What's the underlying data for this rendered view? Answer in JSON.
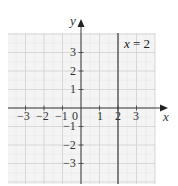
{
  "chart_data": {
    "type": "line",
    "title": "",
    "xlabel": "x",
    "ylabel": "y",
    "xlim": [
      -4,
      4
    ],
    "ylim": [
      -4,
      4
    ],
    "grid": true,
    "x_ticks": [
      "-3",
      "-2",
      "-1",
      "0",
      "1",
      "2",
      "3"
    ],
    "y_ticks": [
      "3",
      "2",
      "1",
      "-1",
      "-2",
      "-3"
    ],
    "origin_label": "0",
    "series": [
      {
        "name": "x = 2",
        "type": "vertical_line",
        "x": 2,
        "y_range": [
          -4,
          4
        ]
      }
    ],
    "annotations": [
      {
        "text": "x = 2",
        "position": "upper-right"
      }
    ]
  },
  "labels": {
    "x_axis": "x",
    "y_axis": "y",
    "line": "x = 2",
    "origin": "0",
    "x_ticks": [
      "−3",
      "−2",
      "−1",
      "1",
      "2",
      "3"
    ],
    "y_ticks_pos": [
      "3",
      "2",
      "1"
    ],
    "y_ticks_neg": [
      "−1",
      "−2",
      "−3"
    ]
  },
  "colors": {
    "grid_bg": "#f4f4f4",
    "grid_major": "#d6d6d6",
    "grid_minor": "#e6e6e6",
    "axis": "#3a3a3a",
    "line": "#4a4a4a"
  }
}
